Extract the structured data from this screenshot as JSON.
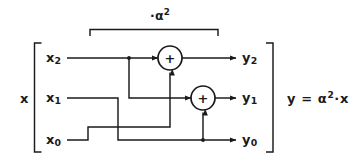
{
  "figure": {
    "type": "signal-flow-diagram",
    "stroke_color": "#1a1a1a",
    "background_color": "#ffffff"
  },
  "scale_annotation": {
    "label_prefix": "·",
    "base": "α",
    "exponent": "2",
    "full_text": "·α²",
    "bracket": "top-span-brace"
  },
  "input_vector": {
    "name": "x",
    "bracket_open": "[",
    "components": [
      {
        "base": "x",
        "index": "2"
      },
      {
        "base": "x",
        "index": "1"
      },
      {
        "base": "x",
        "index": "0"
      }
    ]
  },
  "output_vector": {
    "bracket_close": "]",
    "components": [
      {
        "base": "y",
        "index": "2"
      },
      {
        "base": "y",
        "index": "1"
      },
      {
        "base": "y",
        "index": "0"
      }
    ]
  },
  "adders": [
    {
      "id": "adder-top",
      "symbol": "+",
      "feeds": "y2"
    },
    {
      "id": "adder-bottom",
      "symbol": "+",
      "feeds": "y1"
    }
  ],
  "equation": {
    "lhs": "y",
    "operator": "=",
    "rhs_base": "α",
    "rhs_exponent": "2",
    "rhs_dot": "·",
    "rhs_operand": "x",
    "full_text": "y = α²·x"
  }
}
